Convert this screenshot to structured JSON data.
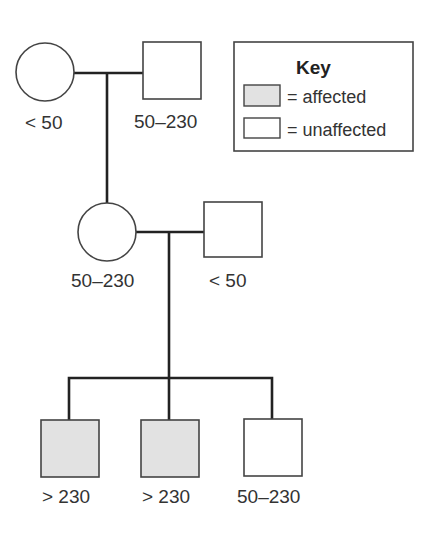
{
  "colors": {
    "line": "#222222",
    "outline": "#444444",
    "affected_fill": "#e2e2e2",
    "unaffected_fill": "#ffffff",
    "text": "#333333"
  },
  "pedigree": {
    "generation_1": [
      {
        "sex": "female",
        "shape": "circle",
        "status": "unaffected",
        "label": "< 50"
      },
      {
        "sex": "male",
        "shape": "square",
        "status": "unaffected",
        "label": "50–230"
      }
    ],
    "generation_2": [
      {
        "sex": "female",
        "shape": "circle",
        "status": "unaffected",
        "label": "50–230"
      },
      {
        "sex": "male",
        "shape": "square",
        "status": "unaffected",
        "label": "< 50"
      }
    ],
    "generation_3": [
      {
        "sex": "male",
        "shape": "square",
        "status": "affected",
        "label": "> 230"
      },
      {
        "sex": "male",
        "shape": "square",
        "status": "affected",
        "label": "> 230"
      },
      {
        "sex": "male",
        "shape": "square",
        "status": "unaffected",
        "label": "50–230"
      }
    ]
  },
  "key": {
    "title": "Key",
    "items": [
      {
        "symbol": "shaded-box",
        "text": "= affected"
      },
      {
        "symbol": "empty-box",
        "text": "= unaffected"
      }
    ]
  }
}
